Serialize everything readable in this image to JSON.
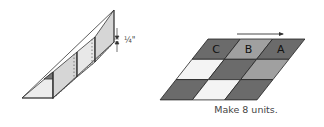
{
  "left_figure": {
    "measurement_label": "¼\""
  },
  "right_figure": {
    "grid_rows": [
      [
        {
          "label": "C",
          "fill": "#6b6b6b"
        },
        {
          "label": "B",
          "fill": "#a0a0a0"
        },
        {
          "label": "A",
          "fill": "#6b6b6b"
        }
      ],
      [
        {
          "label": "",
          "fill": "#f4f4f4"
        },
        {
          "label": "",
          "fill": "#6b6b6b"
        },
        {
          "label": "",
          "fill": "#a0a0a0"
        }
      ],
      [
        {
          "label": "",
          "fill": "#6b6b6b"
        },
        {
          "label": "",
          "fill": "#f4f4f4"
        },
        {
          "label": "",
          "fill": "#6b6b6b"
        }
      ]
    ],
    "caption": "Make 8 units."
  },
  "colors": {
    "line": "#333333",
    "shaded": "#d4d4d4",
    "light": "#ececec"
  }
}
